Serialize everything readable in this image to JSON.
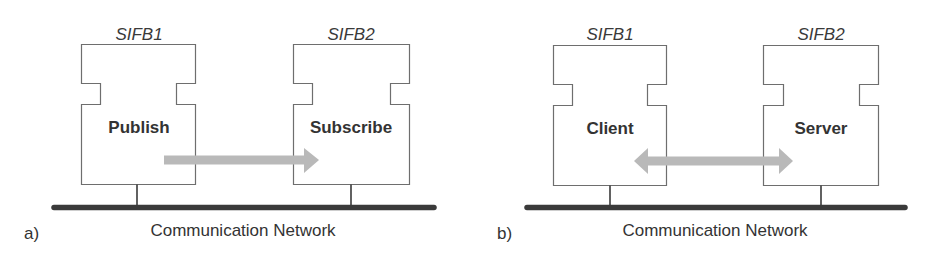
{
  "colors": {
    "block_stroke": "#6e6e6e",
    "network_bar": "#3a3a3a",
    "arrow": "#b9b9b9",
    "text": "#333333"
  },
  "panels": [
    {
      "id": "a",
      "label": "a)",
      "network_label": "Communication Network",
      "blocks": [
        {
          "name": "SIFB1",
          "label": "Publish"
        },
        {
          "name": "SIFB2",
          "label": "Subscribe"
        }
      ],
      "arrow": {
        "type": "unidirectional",
        "direction": "SIFB1 → SIFB2"
      }
    },
    {
      "id": "b",
      "label": "b)",
      "network_label": "Communication Network",
      "blocks": [
        {
          "name": "SIFB1",
          "label": "Client"
        },
        {
          "name": "SIFB2",
          "label": "Server"
        }
      ],
      "arrow": {
        "type": "bidirectional",
        "direction": "SIFB1 ↔ SIFB2"
      }
    }
  ]
}
